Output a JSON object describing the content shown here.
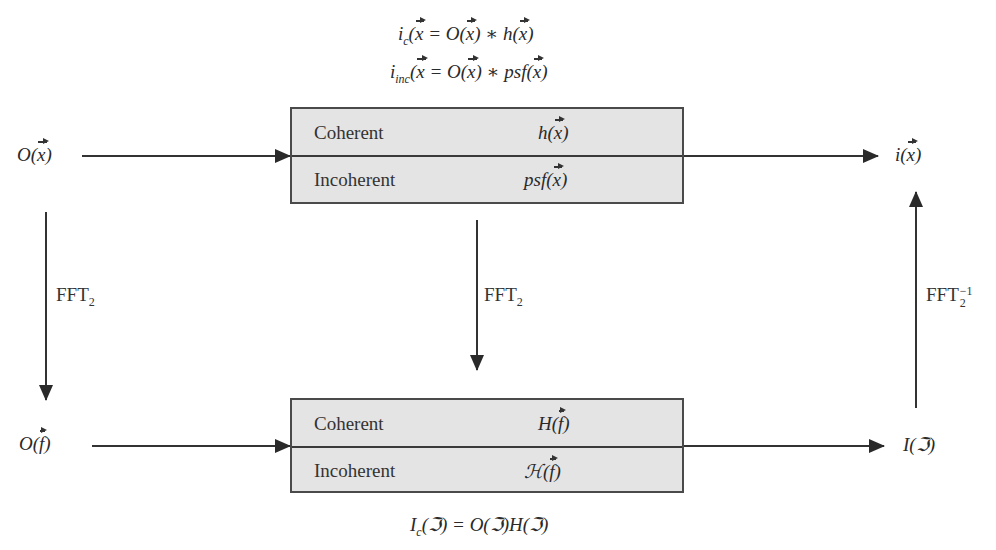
{
  "equations": {
    "top_line1": {
      "lhs": "i",
      "lhs_sub": "c",
      "arg": "x",
      "eq": " = O(",
      "op": ") ∗ h(",
      "end": ")"
    },
    "top_line2": {
      "lhs": "i",
      "lhs_sub": "inc",
      "arg": "x",
      "eq": " = O(",
      "op": ") ∗ psf(",
      "end": ")"
    },
    "bottom": {
      "lhs": "I",
      "lhs_sub": "c",
      "text": "(ℑ) = O(ℑ)H(ℑ)"
    }
  },
  "nodes": {
    "input_spatial": {
      "fn": "O(",
      "arg": "x",
      "close": ")"
    },
    "output_spatial": {
      "fn": "i(",
      "arg": "x",
      "close": ")"
    },
    "input_frequency": {
      "fn": "O(",
      "arg": "f",
      "close": ")"
    },
    "output_frequency": {
      "text": "I(ℑ)"
    }
  },
  "boxes": {
    "spatial": {
      "rows": [
        {
          "label": "Coherent",
          "fn": "h(",
          "arg": "x",
          "close": ")"
        },
        {
          "label": "Incoherent",
          "fn": "psf(",
          "arg": "x",
          "close": ")"
        }
      ]
    },
    "frequency": {
      "rows": [
        {
          "label": "Coherent",
          "fn": "H(",
          "arg": "f",
          "close": ")"
        },
        {
          "label": "Incoherent",
          "fn": "ℋ(",
          "arg": "f",
          "close": ")"
        }
      ]
    }
  },
  "transforms": {
    "left": {
      "base": "FFT",
      "sub": "2",
      "sup": ""
    },
    "middle": {
      "base": "FFT",
      "sub": "2",
      "sup": ""
    },
    "right": {
      "base": "FFT",
      "sub": "2",
      "sup": "−1"
    }
  },
  "colors": {
    "box_fill": "#e4e4e4",
    "stroke": "#333333"
  }
}
